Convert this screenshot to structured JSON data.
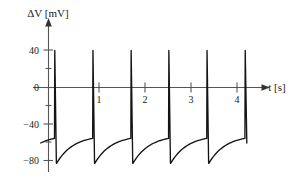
{
  "chart_data": {
    "type": "line",
    "title": "",
    "xlabel": "t [s]",
    "ylabel": "ΔV [mV]",
    "xlim": [
      -0.13,
      5.15
    ],
    "ylim": [
      -95,
      52
    ],
    "xticks": [
      1,
      2,
      3,
      4
    ],
    "xtick_labels": [
      "1",
      "2",
      "3",
      "4"
    ],
    "yticks": [
      40,
      0,
      -40,
      -80
    ],
    "ytick_labels": [
      "40",
      "0",
      "−40",
      "−80"
    ],
    "grid": false,
    "legend": null,
    "series": [
      {
        "name": "membrane-potential",
        "color": "#141414",
        "spike_count": 6,
        "spike_times_s": [
          0.13,
          0.96,
          1.79,
          2.61,
          3.44,
          4.27
        ],
        "period_s": 0.83,
        "spike_peak_mV": 40,
        "reset_mV": -82,
        "threshold_mV": -55,
        "resting_start_mV": -60
      }
    ]
  },
  "axis": {
    "y_label_text": "ΔV [mV]",
    "x_label_text": "t [s]",
    "y_tick_40": "40",
    "y_tick_0": "0",
    "y_tick_m40": "−40",
    "y_tick_m80": "−80",
    "x_tick_1": "1",
    "x_tick_2": "2",
    "x_tick_3": "3",
    "x_tick_4": "4"
  },
  "colors": {
    "trace": "#141414",
    "axis": "#555555",
    "text": "#1a1a1a",
    "background": "#ffffff"
  }
}
